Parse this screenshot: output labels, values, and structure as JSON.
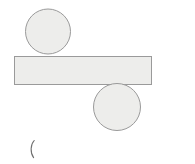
{
  "page": {
    "background_color": "#ffffff",
    "width": 195,
    "height": 164
  },
  "style": {
    "shape_fill_color": "#ededeb",
    "shape_stroke_color": "#9a9a9a",
    "mark_stroke_color": "#6f6f6f",
    "stroke_width": 1
  },
  "diagram": {
    "name": "bar-with-two-circles",
    "shapes": [
      {
        "id": "top-circle",
        "type": "circle",
        "label": "",
        "cx": 48,
        "cy": 31.5,
        "r": 22.5
      },
      {
        "id": "horizontal-bar",
        "type": "rectangle",
        "label": "",
        "x": 14.5,
        "y": 56.5,
        "width": 137,
        "height": 28
      },
      {
        "id": "bottom-circle",
        "type": "circle",
        "label": "",
        "cx": 117,
        "cy": 107,
        "r": 23.5
      }
    ],
    "marks": [
      {
        "id": "paren-mark",
        "type": "parenthesis",
        "glyph": "(",
        "x": 29,
        "y": 140,
        "width": 6,
        "height": 18
      }
    ]
  }
}
